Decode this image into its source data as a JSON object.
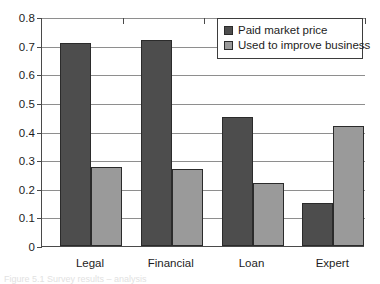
{
  "chart_data": {
    "type": "bar",
    "title": "",
    "xlabel": "",
    "ylabel": "",
    "categories": [
      "Legal",
      "Financial",
      "Loan",
      "Expert"
    ],
    "series": [
      {
        "name": "Paid market price",
        "color": "#4d4d4d",
        "values": [
          0.71,
          0.72,
          0.45,
          0.15
        ]
      },
      {
        "name": "Used to improve business",
        "color": "#9a9a9a",
        "values": [
          0.275,
          0.27,
          0.22,
          0.42
        ]
      }
    ],
    "ylim": [
      0,
      0.8
    ],
    "ytick_values": [
      0,
      0.1,
      0.2,
      0.3,
      0.4,
      0.5,
      0.6,
      0.7,
      0.8
    ],
    "ytick_labels": [
      "0",
      "0.1",
      "0.2",
      "0.3",
      "0.4",
      "0.5",
      "0.6",
      "0.7",
      "0.8"
    ],
    "grid": true,
    "legend_position": "top-right"
  },
  "legend": {
    "entries": [
      {
        "label": "Paid market price"
      },
      {
        "label": "Used to improve business"
      }
    ]
  },
  "caption": {
    "text": "Figure 5.1  Survey results – analysis"
  }
}
